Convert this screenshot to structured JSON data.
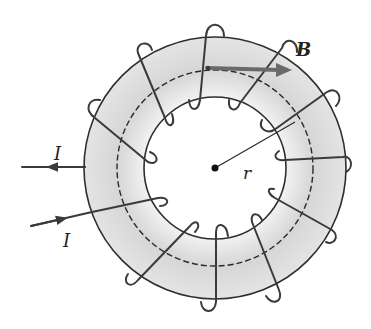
{
  "figure": {
    "labels": {
      "field": "B",
      "current_in": "I",
      "current_out": "I",
      "radius": "r"
    },
    "colors": {
      "ring_fill": "#dcdcdc",
      "ring_fill_light": "#efefef",
      "wire": "#3a3a3a",
      "field_arrow": "#6a6a6a",
      "background": "#ffffff"
    },
    "geometry": {
      "center": [
        215,
        168
      ],
      "outer_radius": 131,
      "inner_radius": 71,
      "mean_radius": 98,
      "winding_count": 11
    }
  }
}
